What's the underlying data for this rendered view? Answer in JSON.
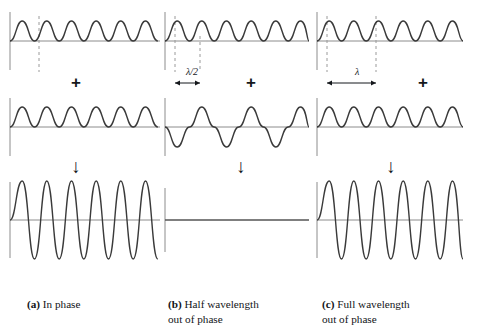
{
  "figure": {
    "colors": {
      "wave": "#3a3a3a",
      "axis": "#8c8c8c",
      "dashed_guide": "#9a9a9a",
      "text": "#121417",
      "background": "#ffffff"
    }
  },
  "symbols": {
    "plus": "+",
    "down_arrow": "↓"
  },
  "panels": [
    {
      "id": "a",
      "tag": "(a)",
      "caption": "In phase",
      "caption_full": "(a) In phase",
      "phase_shift_label": "",
      "waves": [
        {
          "role": "input-wave-1",
          "amplitude": 20,
          "wavelength": 49,
          "phase_deg": 0,
          "cycles": 3
        },
        {
          "role": "input-wave-2",
          "amplitude": 20,
          "wavelength": 49,
          "phase_deg": 0,
          "cycles": 3
        },
        {
          "role": "resultant-wave",
          "amplitude": 40,
          "wavelength": 49,
          "phase_deg": 0,
          "cycles": 3
        }
      ],
      "result_type": "constructive",
      "guides": [
        {
          "type": "dashed-crest-line",
          "x": 37
        }
      ]
    },
    {
      "id": "b",
      "tag": "(b)",
      "caption": "Half wavelength\nout of phase",
      "caption_full": "(b) Half wavelength out of phase",
      "phase_shift_label": "λ/2",
      "waves": [
        {
          "role": "input-wave-1",
          "amplitude": 20,
          "wavelength": 49,
          "phase_deg": 0,
          "cycles": 3
        },
        {
          "role": "input-wave-2",
          "amplitude": 20,
          "wavelength": 49,
          "phase_deg": 180,
          "cycles": 3
        },
        {
          "role": "resultant-wave",
          "amplitude": 0,
          "wavelength": 49,
          "phase_deg": 0,
          "cycles": 3
        }
      ],
      "result_type": "destructive",
      "guides": [
        {
          "type": "dashed-crest-line",
          "x": 18
        },
        {
          "type": "dashed-crest-line",
          "x": 43
        }
      ]
    },
    {
      "id": "c",
      "tag": "(c)",
      "caption": "Full wavelength\nout of phase",
      "caption_full": "(c) Full wavelength out of phase",
      "phase_shift_label": "λ",
      "waves": [
        {
          "role": "input-wave-1",
          "amplitude": 20,
          "wavelength": 49,
          "phase_deg": 0,
          "cycles": 3
        },
        {
          "role": "input-wave-2",
          "amplitude": 20,
          "wavelength": 49,
          "phase_deg": 360,
          "cycles": 3
        },
        {
          "role": "resultant-wave",
          "amplitude": 40,
          "wavelength": 49,
          "phase_deg": 0,
          "cycles": 3
        }
      ],
      "result_type": "constructive",
      "guides": [
        {
          "type": "dashed-crest-line",
          "x": 20
        },
        {
          "type": "dashed-crest-line",
          "x": 69
        }
      ]
    }
  ]
}
